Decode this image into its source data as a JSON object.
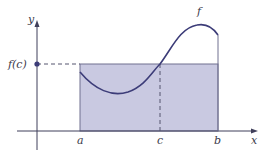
{
  "figure": {
    "type": "mean-value-theorem-for-integrals",
    "labels": {
      "y_axis": "y",
      "x_axis": "x",
      "function": "f",
      "fc": "f(c)",
      "a": "a",
      "b": "b",
      "c": "c"
    },
    "colors": {
      "axis": "#3f3f5a",
      "curve": "#3c3c78",
      "rect_fill": "#c8c8e0",
      "rect_stroke": "#6e6e8c",
      "dot": "#3c3c78",
      "dashed": "#55556e"
    }
  }
}
